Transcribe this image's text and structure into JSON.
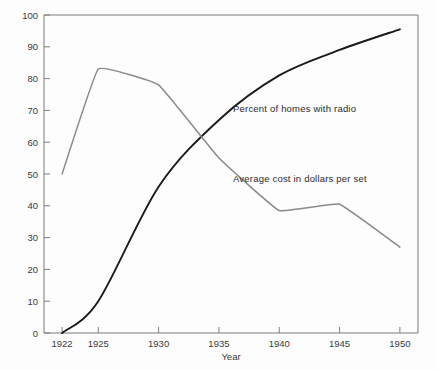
{
  "chart_data": {
    "type": "line",
    "title": "",
    "xlabel": "Year",
    "ylabel": "",
    "x": [
      1922,
      1925,
      1930,
      1935,
      1940,
      1945,
      1950
    ],
    "xtick_labels": [
      "1922",
      "1925",
      "1930",
      "1935",
      "1940",
      "1945",
      "1950"
    ],
    "ytick_labels": [
      "0",
      "10",
      "20",
      "30",
      "40",
      "50",
      "60",
      "70",
      "80",
      "90",
      "100"
    ],
    "yticks": [
      0,
      10,
      20,
      30,
      40,
      50,
      60,
      70,
      80,
      90,
      100
    ],
    "ylim": [
      0,
      100
    ],
    "xlim": [
      1920.5,
      1951.5
    ],
    "grid": false,
    "legend_position": "inline-annotation",
    "series": [
      {
        "name": "Percent of homes with radio",
        "color": "#1a1a1a",
        "values": [
          0,
          10,
          46,
          67,
          81,
          89,
          95.5
        ],
        "annotation": "Percent of homes with radio"
      },
      {
        "name": "Average cost in dollars per set",
        "color": "#8a8a8a",
        "values": [
          50,
          83,
          78,
          55,
          38.5,
          40.5,
          27
        ],
        "annotation": "Average cost in dollars per set"
      }
    ]
  },
  "annotations": {
    "radio_label": "Percent of homes with radio",
    "cost_label": "Average cost in dollars per set"
  },
  "axes": {
    "x_title": "Year"
  }
}
